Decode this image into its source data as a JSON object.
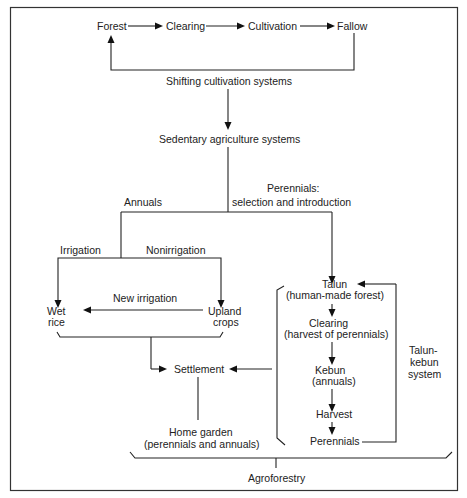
{
  "diagram": {
    "shifting": {
      "forest": "Forest",
      "clearing": "Clearing",
      "cultivation": "Cultivation",
      "fallow": "Fallow",
      "label": "Shifting cultivation systems"
    },
    "sedentary": {
      "label": "Sedentary agriculture systems",
      "annuals": "Annuals",
      "perennials_1": "Perennials:",
      "perennials_2": "selection and introduction"
    },
    "annuals_branch": {
      "irrigation": "Irrigation",
      "nonirrigation": "Nonirrigation",
      "new_irrigation": "New irrigation",
      "wet_rice_1": "Wet",
      "wet_rice_2": "rice",
      "upland_1": "Upland",
      "upland_2": "crops",
      "settlement": "Settlement",
      "home_garden_1": "Home garden",
      "home_garden_2": "(perennials and annuals)"
    },
    "talun_kebun": {
      "talun_1": "Talun",
      "talun_2": "(human-made forest)",
      "clearing_1": "Clearing",
      "clearing_2": "(harvest of perennials)",
      "kebun_1": "Kebun",
      "kebun_2": "(annuals)",
      "harvest": "Harvest",
      "perennials": "Perennials",
      "system_1": "Talun-",
      "system_2": "kebun",
      "system_3": "system"
    },
    "agroforestry": "Agroforestry"
  }
}
